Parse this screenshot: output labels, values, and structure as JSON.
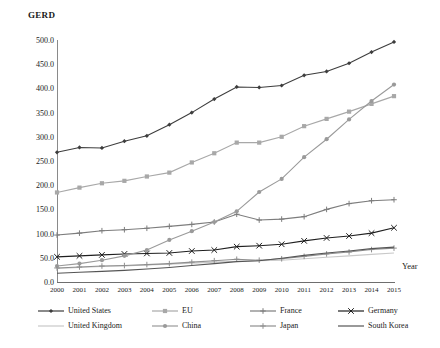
{
  "chart_data": {
    "type": "line",
    "title": "",
    "ylabel": "GERD",
    "xlabel": "Year",
    "grid": false,
    "legend_position": "bottom",
    "ylim": [
      0,
      500
    ],
    "yticks": [
      "0.0",
      "50.0",
      "100.0",
      "150.0",
      "200.0",
      "250.0",
      "300.0",
      "350.0",
      "400.0",
      "450.0",
      "500.0"
    ],
    "ytick_values": [
      0,
      50,
      100,
      150,
      200,
      250,
      300,
      350,
      400,
      450,
      500
    ],
    "categories": [
      "2000",
      "2001",
      "2002",
      "2003",
      "2004",
      "2005",
      "2006",
      "2007",
      "2008",
      "2009",
      "2010",
      "2011",
      "2012",
      "2013",
      "2014",
      "2015"
    ],
    "series": [
      {
        "name": "United States",
        "color": "#3d3d3d",
        "marker": "diamond",
        "values": [
          268,
          278,
          277,
          291,
          302,
          325,
          350,
          378,
          403,
          402,
          406,
          427,
          435,
          452,
          475,
          496
        ]
      },
      {
        "name": "EU",
        "color": "#a8a8a8",
        "marker": "square",
        "values": [
          185,
          195,
          204,
          209,
          218,
          226,
          247,
          266,
          288,
          288,
          300,
          322,
          337,
          352,
          368,
          384
        ]
      },
      {
        "name": "France",
        "color": "#7d7d7d",
        "marker": "plus",
        "values": [
          97,
          101,
          106,
          108,
          111,
          115,
          119,
          124,
          140,
          128,
          130,
          135,
          150,
          162,
          168,
          170
        ]
      },
      {
        "name": "Germany",
        "color": "#1f1f1f",
        "marker": "x",
        "values": [
          52,
          54,
          56,
          58,
          59,
          60,
          64,
          66,
          73,
          75,
          78,
          85,
          91,
          95,
          101,
          112
        ]
      },
      {
        "name": "United Kingdom",
        "color": "#c9c9c9",
        "marker": "none",
        "values": [
          28,
          30,
          32,
          33,
          35,
          37,
          39,
          41,
          43,
          44,
          45,
          48,
          51,
          54,
          57,
          60
        ]
      },
      {
        "name": "China",
        "color": "#9a9a9a",
        "marker": "circle",
        "values": [
          33,
          38,
          45,
          54,
          66,
          87,
          105,
          124,
          146,
          186,
          213,
          258,
          295,
          336,
          374,
          408
        ]
      },
      {
        "name": "Japan",
        "color": "#8f8f8f",
        "marker": "plus",
        "values": [
          29,
          31,
          33,
          34,
          36,
          38,
          41,
          44,
          47,
          45,
          48,
          53,
          58,
          62,
          67,
          70
        ]
      },
      {
        "name": "South Korea",
        "color": "#555555",
        "marker": "none",
        "values": [
          18,
          20,
          22,
          24,
          27,
          30,
          34,
          38,
          42,
          44,
          49,
          55,
          60,
          64,
          69,
          72
        ]
      }
    ]
  },
  "legend": {
    "items": [
      {
        "label": "United States"
      },
      {
        "label": "EU"
      },
      {
        "label": "France"
      },
      {
        "label": "Germany"
      },
      {
        "label": "United Kingdom"
      },
      {
        "label": "China"
      },
      {
        "label": "Japan"
      },
      {
        "label": "South Korea"
      }
    ]
  }
}
